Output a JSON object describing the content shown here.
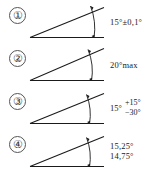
{
  "figure": {
    "stroke_color": "#1a1a1a",
    "rows": [
      {
        "callout": "①",
        "diagram": {
          "name": "angle-diagram-symmetric-tolerance",
          "angle_deg": 15,
          "baseline_label": "horizontal datum line",
          "arc_arrow": "double-headed"
        },
        "annotation_lines": [
          "15°±0,1°"
        ],
        "nominal": "15",
        "tolerance": "±0,1"
      },
      {
        "callout": "②",
        "diagram": {
          "name": "angle-diagram-max-limit",
          "angle_deg": 20,
          "baseline_label": "horizontal datum line",
          "arc_arrow": "double-headed"
        },
        "annotation_lines": [
          "20°max"
        ],
        "nominal": "20",
        "tolerance": "max"
      },
      {
        "callout": "③",
        "diagram": {
          "name": "angle-diagram-unequal-tolerance",
          "angle_deg": 15,
          "baseline_label": "horizontal datum line",
          "arc_arrow": "double-headed"
        },
        "annotation_base": "15°",
        "annotation_upper": "+15°",
        "annotation_lower": "−30°",
        "nominal": "15",
        "tolerance_upper": "+15",
        "tolerance_lower": "-30"
      },
      {
        "callout": "④",
        "diagram": {
          "name": "angle-diagram-limit-dimensions",
          "angle_deg": 15,
          "baseline_label": "horizontal datum line",
          "arc_arrow": "double-headed"
        },
        "annotation_lines": [
          "15,25°",
          "14,75°"
        ],
        "limit_upper": "15,25",
        "limit_lower": "14,75"
      }
    ]
  }
}
